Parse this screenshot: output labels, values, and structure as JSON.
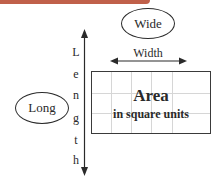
{
  "header": {
    "bar_color": "#c0604a"
  },
  "labels": {
    "wide": "Wide",
    "long": "Long",
    "width": "Width",
    "length_letters": [
      "L",
      "e",
      "n",
      "g",
      "t",
      "h"
    ]
  },
  "area": {
    "title": "Area",
    "subtitle": "in square units",
    "grid": {
      "columns": 5,
      "rows": 3
    }
  }
}
